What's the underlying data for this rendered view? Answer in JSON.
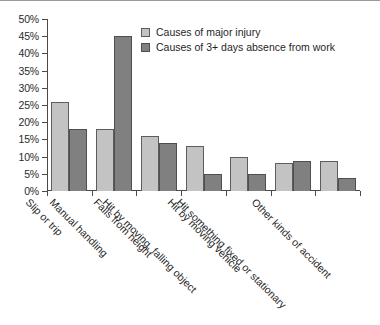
{
  "chart_data": {
    "type": "bar",
    "title": "",
    "xlabel": "",
    "ylabel": "",
    "ylim": [
      0,
      50
    ],
    "ytick_labels": [
      "0%",
      "5%",
      "10%",
      "15%",
      "20%",
      "25%",
      "30%",
      "35%",
      "40%",
      "45%",
      "50%"
    ],
    "ytick_values": [
      0,
      5,
      10,
      15,
      20,
      25,
      30,
      35,
      40,
      45,
      50
    ],
    "grid": false,
    "legend_position": "top-center",
    "categories": [
      "Slip or trip",
      "Manual handling",
      "Falls from height",
      "Hit by moving, falling object",
      "Hit by moving vehicle",
      "Hit something fixed or stationary",
      "Other kinds of accident"
    ],
    "series": [
      {
        "name": "Causes of major injury",
        "color": "#c3c3c3",
        "values": [
          26,
          18,
          16,
          13,
          10,
          8,
          8.7
        ]
      },
      {
        "name": "Causes of 3+ days absence from work",
        "color": "#808080",
        "values": [
          18,
          45,
          14,
          5,
          5,
          8.7,
          3.8
        ]
      }
    ]
  },
  "colors": {
    "series_major_injury": "#c3c3c3",
    "series_absence": "#808080",
    "axis": "#4a4a4a",
    "text": "#1f1f1f",
    "background": "#ffffff"
  }
}
